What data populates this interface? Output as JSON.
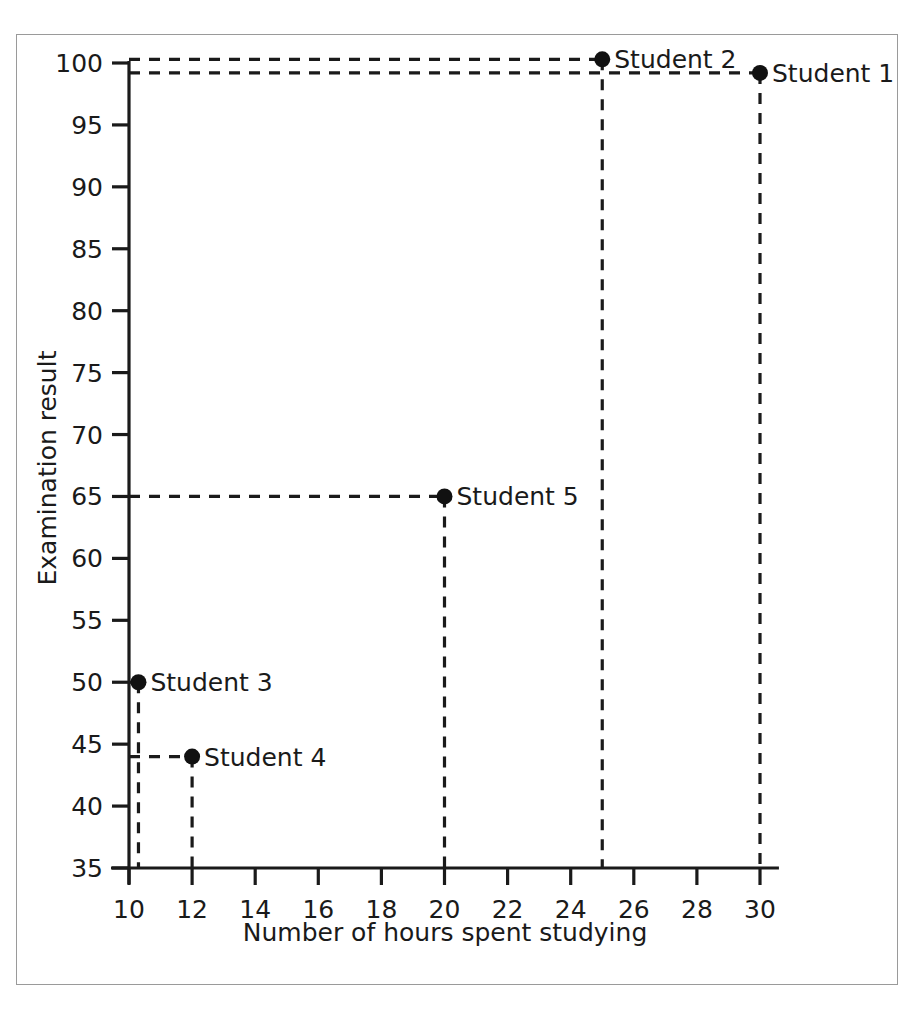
{
  "chart_data": {
    "type": "scatter",
    "title": "",
    "xlabel": "Number of hours spent studying",
    "ylabel": "Examination result",
    "xlim": [
      9.3,
      30.8
    ],
    "ylim": [
      35,
      101
    ],
    "xticks": [
      10,
      12,
      14,
      16,
      18,
      20,
      22,
      24,
      26,
      28,
      30
    ],
    "yticks": [
      35,
      40,
      45,
      50,
      55,
      60,
      65,
      70,
      75,
      80,
      85,
      90,
      95,
      100
    ],
    "xtick_labels": [
      "10",
      "12",
      "14",
      "16",
      "18",
      "20",
      "22",
      "24",
      "26",
      "28",
      "30"
    ],
    "ytick_labels": [
      "35",
      "40",
      "45",
      "50",
      "55",
      "60",
      "65",
      "70",
      "75",
      "80",
      "85",
      "90",
      "95",
      "100"
    ],
    "grid": false,
    "legend": "none",
    "guide_lines": "dashed-to-axes",
    "marker_color": "#111111",
    "axis_color": "#1a1a1a",
    "points": [
      {
        "label": "Student 1",
        "x": 30.0,
        "y": 99.2
      },
      {
        "label": "Student 2",
        "x": 25.0,
        "y": 100.3
      },
      {
        "label": "Student 3",
        "x": 10.3,
        "y": 50.0
      },
      {
        "label": "Student 4",
        "x": 12.0,
        "y": 44.0
      },
      {
        "label": "Student 5",
        "x": 20.0,
        "y": 65.0
      }
    ]
  },
  "figure": {
    "border_color": "#9a9a9a",
    "background": "#ffffff"
  }
}
